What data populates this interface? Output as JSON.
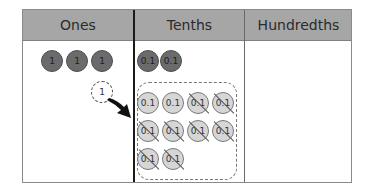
{
  "table": {
    "headers": [
      "Ones",
      "Tenths",
      "Hundredths"
    ],
    "header_bg": "#a6a6a6",
    "divider_color": "#1a1a1a"
  },
  "ones": {
    "counters": [
      {
        "label": "1",
        "style": "dark"
      },
      {
        "label": "1",
        "style": "dark"
      },
      {
        "label": "1",
        "style": "dark"
      }
    ],
    "exchanged_counter": {
      "label": "1",
      "style": "dashed"
    }
  },
  "tenths": {
    "counters": [
      {
        "label": "0.1",
        "style": "dark"
      },
      {
        "label": "0.1",
        "style": "dark"
      }
    ],
    "exchange_group": {
      "rows": [
        [
          {
            "label": "0.1",
            "crossed": false
          },
          {
            "label": "0.1",
            "crossed": false
          },
          {
            "label": "0.1",
            "crossed": true
          },
          {
            "label": "0.1",
            "crossed": true
          }
        ],
        [
          {
            "label": "0.1",
            "crossed": true
          },
          {
            "label": "0.1",
            "crossed": true
          },
          {
            "label": "0.1",
            "crossed": true
          },
          {
            "label": "0.1",
            "crossed": true
          }
        ],
        [
          {
            "label": "0.1",
            "crossed": true
          },
          {
            "label": "0.1",
            "crossed": true
          }
        ]
      ]
    }
  },
  "hundredths": {
    "counters": []
  },
  "arrow": {
    "from": "ones",
    "to": "tenths",
    "color": "#111111"
  }
}
